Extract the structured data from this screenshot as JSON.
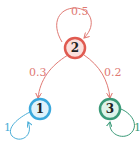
{
  "diagram": {
    "type": "markov-chain",
    "nodes": [
      {
        "id": "1",
        "label": "1",
        "stroke": "#3aa8dc",
        "fill": "#dff2fb"
      },
      {
        "id": "2",
        "label": "2",
        "stroke": "#e05a50",
        "fill": "#fbe0dc"
      },
      {
        "id": "3",
        "label": "3",
        "stroke": "#3a9a78",
        "fill": "#dff3ea"
      }
    ],
    "edges": [
      {
        "from": "2",
        "to": "2",
        "label": "0.5",
        "color": "#e07a74"
      },
      {
        "from": "2",
        "to": "1",
        "label": "0.3",
        "color": "#e07a74"
      },
      {
        "from": "2",
        "to": "3",
        "label": "0.2",
        "color": "#e07a74"
      },
      {
        "from": "1",
        "to": "1",
        "label": "1",
        "color": "#4aaed8"
      },
      {
        "from": "3",
        "to": "3",
        "label": "1",
        "color": "#3a9a78"
      }
    ]
  }
}
